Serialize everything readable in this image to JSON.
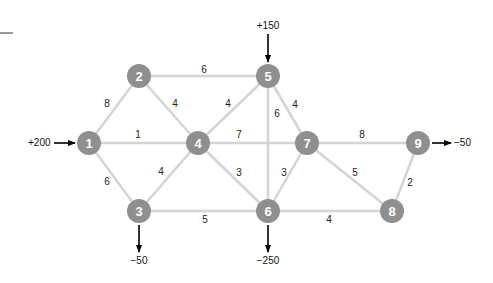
{
  "diagram": {
    "type": "network-flow-graph",
    "nodes": [
      {
        "id": "1",
        "label": "1",
        "x": 89,
        "y": 143
      },
      {
        "id": "2",
        "label": "2",
        "x": 139,
        "y": 76
      },
      {
        "id": "3",
        "label": "3",
        "x": 139,
        "y": 211
      },
      {
        "id": "4",
        "label": "4",
        "x": 198,
        "y": 143
      },
      {
        "id": "5",
        "label": "5",
        "x": 268,
        "y": 76
      },
      {
        "id": "6",
        "label": "6",
        "x": 268,
        "y": 211
      },
      {
        "id": "7",
        "label": "7",
        "x": 307,
        "y": 143
      },
      {
        "id": "8",
        "label": "8",
        "x": 392,
        "y": 211
      },
      {
        "id": "9",
        "label": "9",
        "x": 418,
        "y": 143
      }
    ],
    "edges": [
      {
        "from": "1",
        "to": "2",
        "weight": "8",
        "lx": 107,
        "ly": 103
      },
      {
        "from": "1",
        "to": "4",
        "weight": "1",
        "lx": 138,
        "ly": 134
      },
      {
        "from": "1",
        "to": "3",
        "weight": "6",
        "lx": 107,
        "ly": 181
      },
      {
        "from": "2",
        "to": "5",
        "weight": "6",
        "lx": 204,
        "ly": 69
      },
      {
        "from": "2",
        "to": "4",
        "weight": "4",
        "lx": 175,
        "ly": 103
      },
      {
        "from": "3",
        "to": "4",
        "weight": "4",
        "lx": 161,
        "ly": 171
      },
      {
        "from": "3",
        "to": "6",
        "weight": "5",
        "lx": 205,
        "ly": 219
      },
      {
        "from": "4",
        "to": "5",
        "weight": "4",
        "lx": 228,
        "ly": 103
      },
      {
        "from": "4",
        "to": "7",
        "weight": "7",
        "lx": 239,
        "ly": 134
      },
      {
        "from": "4",
        "to": "6",
        "weight": "3",
        "lx": 239,
        "ly": 172
      },
      {
        "from": "5",
        "to": "6",
        "weight": "6",
        "lx": 277,
        "ly": 113
      },
      {
        "from": "5",
        "to": "7",
        "weight": "4",
        "lx": 295,
        "ly": 104
      },
      {
        "from": "6",
        "to": "7",
        "weight": "3",
        "lx": 284,
        "ly": 172
      },
      {
        "from": "6",
        "to": "8",
        "weight": "4",
        "lx": 329,
        "ly": 219
      },
      {
        "from": "7",
        "to": "9",
        "weight": "8",
        "lx": 362,
        "ly": 134
      },
      {
        "from": "7",
        "to": "8",
        "weight": "5",
        "lx": 355,
        "ly": 172
      },
      {
        "from": "8",
        "to": "9",
        "weight": "2",
        "lx": 410,
        "ly": 182
      }
    ],
    "flows": [
      {
        "node": "1",
        "label": "+200",
        "direction": "in",
        "x1": 54,
        "y1": 143,
        "x2": 75,
        "y2": 143,
        "lx": 28,
        "ly": 142,
        "anchor": "start"
      },
      {
        "node": "5",
        "label": "+150",
        "direction": "in",
        "x1": 268,
        "y1": 34,
        "x2": 268,
        "y2": 62,
        "lx": 268,
        "ly": 25,
        "anchor": "middle"
      },
      {
        "node": "3",
        "label": "−50",
        "direction": "out",
        "x1": 139,
        "y1": 225,
        "x2": 139,
        "y2": 252,
        "lx": 139,
        "ly": 260,
        "anchor": "middle"
      },
      {
        "node": "6",
        "label": "−250",
        "direction": "out",
        "x1": 268,
        "y1": 225,
        "x2": 268,
        "y2": 252,
        "lx": 268,
        "ly": 260,
        "anchor": "middle"
      },
      {
        "node": "9",
        "label": "−50",
        "direction": "out",
        "x1": 432,
        "y1": 143,
        "x2": 451,
        "y2": 143,
        "lx": 454,
        "ly": 142,
        "anchor": "start"
      }
    ],
    "colors": {
      "node_fill": "#8f8f8f",
      "node_text": "#ffffff",
      "edge": "#d4d4d4",
      "arrow": "#000000",
      "text": "#222222"
    },
    "node_radius": 12
  }
}
